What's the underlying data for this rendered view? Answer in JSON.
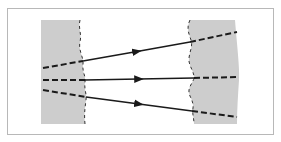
{
  "diagram": {
    "type": "ray-refraction-through-slabs",
    "frame": {
      "x": 7,
      "y": 8,
      "width": 266,
      "height": 126,
      "stroke": "#b8b8b8"
    },
    "colors": {
      "background": "#ffffff",
      "slab_fill": "#cdcdcd",
      "line": "#1a1a1a",
      "boundary": "#333333"
    },
    "left_slab": {
      "x": 41,
      "y": 20,
      "height": 104
    },
    "right_slab": {
      "right_x": 237,
      "y": 20,
      "height": 104
    },
    "rays": [
      {
        "name": "top-ray",
        "dashed_in": [
          [
            43,
            68
          ],
          [
            83,
            61
          ]
        ],
        "solid": [
          [
            83,
            61
          ],
          [
            190,
            42
          ]
        ],
        "dashed_out": [
          [
            190,
            42
          ],
          [
            237,
            32
          ]
        ]
      },
      {
        "name": "middle-ray",
        "dashed_in": [
          [
            43,
            80
          ],
          [
            85,
            80
          ]
        ],
        "solid": [
          [
            85,
            80
          ],
          [
            194,
            78
          ]
        ],
        "dashed_out": [
          [
            194,
            78
          ],
          [
            239,
            77
          ]
        ]
      },
      {
        "name": "bottom-ray",
        "dashed_in": [
          [
            43,
            90
          ],
          [
            86,
            97
          ]
        ],
        "solid": [
          [
            86,
            97
          ],
          [
            192,
            111
          ]
        ],
        "dashed_out": [
          [
            192,
            111
          ],
          [
            237,
            117
          ]
        ]
      }
    ]
  }
}
